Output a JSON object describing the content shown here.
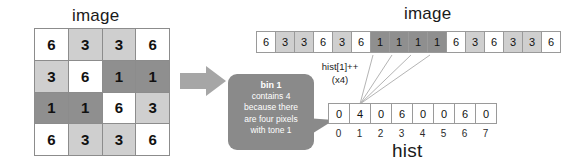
{
  "labels": {
    "image_left_title": "image",
    "image_right_title": "image",
    "hist_title": "hist"
  },
  "annotation": {
    "line1": "hist[1]++",
    "line2": "(x4)"
  },
  "callout": {
    "line1": "bin 1",
    "line2": "contains 4",
    "line3": "because there",
    "line4": "are four pixels",
    "line5": "with tone 1"
  },
  "colors": {
    "tone_6": "#ffffff",
    "tone_3": "#cfcfcf",
    "tone_1": "#8f8f8f",
    "callout_bg": "#8a8a8a",
    "arrow": "#a6a6a6",
    "border": "#8c8c8c",
    "text": "#111111"
  },
  "chart_data": {
    "type": "table",
    "title": "image",
    "image_grid": {
      "rows": 4,
      "cols": 4,
      "values": [
        [
          6,
          3,
          3,
          6
        ],
        [
          3,
          6,
          1,
          1
        ],
        [
          1,
          1,
          6,
          3
        ],
        [
          6,
          3,
          3,
          6
        ]
      ]
    },
    "image_strip": {
      "label": "image",
      "values": [
        6,
        3,
        3,
        6,
        3,
        6,
        1,
        1,
        1,
        1,
        6,
        3,
        6,
        3,
        3,
        6
      ],
      "highlighted_indices": [
        6,
        7,
        8,
        9
      ],
      "highlighted_value": 1
    },
    "histogram": {
      "label": "hist",
      "bins": [
        0,
        1,
        2,
        3,
        4,
        5,
        6,
        7
      ],
      "counts": [
        0,
        4,
        0,
        6,
        0,
        0,
        6,
        0
      ],
      "highlighted_bin": 1,
      "highlighted_count": 4
    }
  }
}
